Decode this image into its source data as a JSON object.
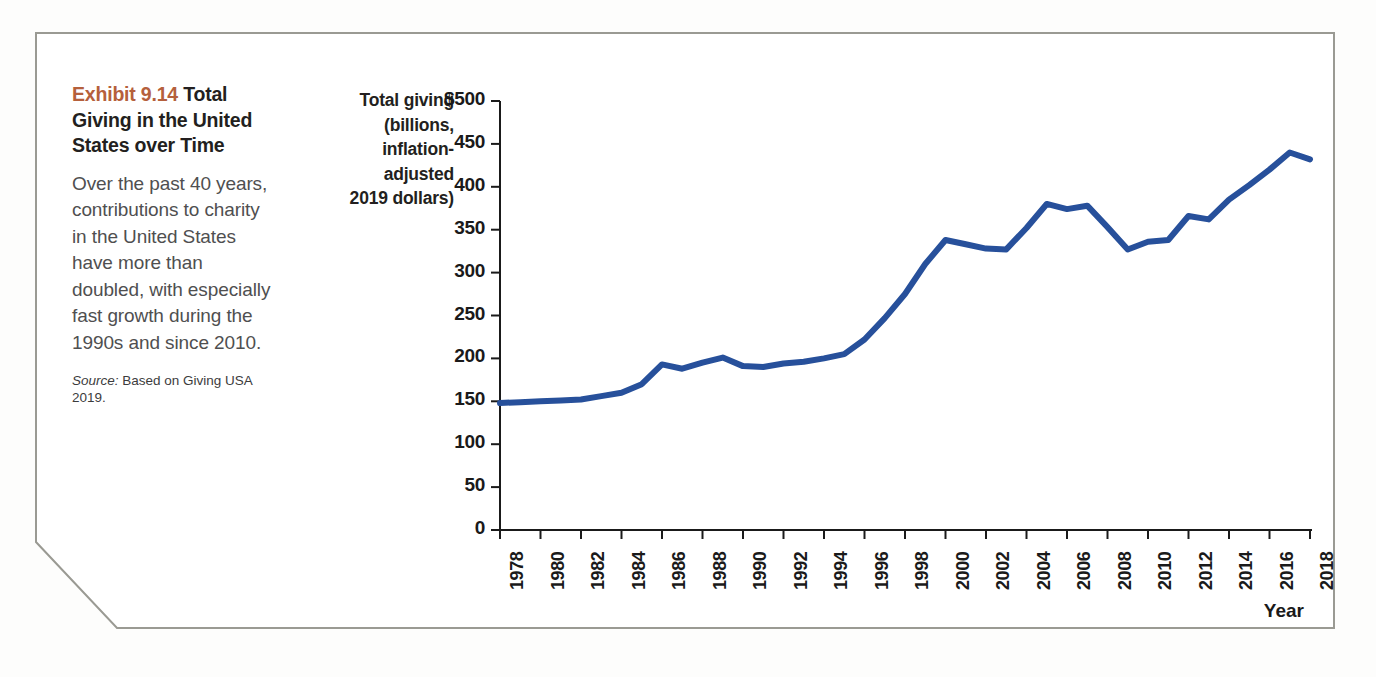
{
  "exhibit": {
    "number": "Exhibit 9.14",
    "title": "Total Giving in the United States over Time",
    "body": "Over the past 40 years, contributions to charity in the United States have more than doubled, with especially fast growth during the 1990s and since 2010.",
    "source_label": "Source:",
    "source_text": "Based on Giving USA 2019.",
    "accent_color": "#b5603c"
  },
  "chart_data": {
    "type": "line",
    "title": "Total Giving in the United States over Time",
    "xlabel": "Year",
    "ylabel": "Total giving (billions, inflation-adjusted 2019 dollars)",
    "ylabel_lines": [
      "Total giving",
      "(billions,",
      "inflation-",
      "adjusted",
      "2019 dollars)"
    ],
    "series_color": "#27509b",
    "grid": false,
    "legend": null,
    "xlim": [
      1978,
      2018
    ],
    "ylim": [
      0,
      500
    ],
    "ytick_labels": [
      "$500",
      "450",
      "400",
      "350",
      "300",
      "250",
      "200",
      "150",
      "100",
      "50",
      "0"
    ],
    "yticks": [
      500,
      450,
      400,
      350,
      300,
      250,
      200,
      150,
      100,
      50,
      0
    ],
    "xtick_labels": [
      "1978",
      "1980",
      "1982",
      "1984",
      "1986",
      "1988",
      "1990",
      "1992",
      "1994",
      "1996",
      "1998",
      "2000",
      "2002",
      "2004",
      "2006",
      "2008",
      "2010",
      "2012",
      "2014",
      "2016",
      "2018"
    ],
    "xticks": [
      1978,
      1980,
      1982,
      1984,
      1986,
      1988,
      1990,
      1992,
      1994,
      1996,
      1998,
      2000,
      2002,
      2004,
      2006,
      2008,
      2010,
      2012,
      2014,
      2016,
      2018
    ],
    "x": [
      1978,
      1979,
      1980,
      1981,
      1982,
      1983,
      1984,
      1985,
      1986,
      1987,
      1988,
      1989,
      1990,
      1991,
      1992,
      1993,
      1994,
      1995,
      1996,
      1997,
      1998,
      1999,
      2000,
      2001,
      2002,
      2003,
      2004,
      2005,
      2006,
      2007,
      2008,
      2009,
      2010,
      2011,
      2012,
      2013,
      2014,
      2015,
      2016,
      2017,
      2018
    ],
    "values": [
      148,
      149,
      150,
      151,
      152,
      156,
      160,
      170,
      193,
      188,
      195,
      201,
      191,
      190,
      194,
      196,
      200,
      205,
      222,
      247,
      275,
      310,
      338,
      333,
      328,
      327,
      352,
      380,
      374,
      378,
      353,
      327,
      336,
      338,
      366,
      362,
      385,
      402,
      420,
      440,
      432
    ],
    "xlabel_rotation": -90
  }
}
